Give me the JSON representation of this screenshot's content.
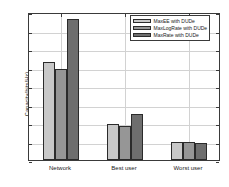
{
  "chart_data": {
    "type": "bar",
    "title": "",
    "xlabel": "",
    "ylabel": "Capacity(bits/Hz)",
    "categories": [
      "Network",
      "Best user",
      "Worst user"
    ],
    "series": [
      {
        "name": "MaxEE with DUDe",
        "values": [
          10.6,
          3.85,
          1.9
        ],
        "color": "#c8c8c8"
      },
      {
        "name": "MaxLogRate with DUDe",
        "values": [
          9.8,
          3.7,
          2.0
        ],
        "color": "#969696"
      },
      {
        "name": "MaxRate with DUDe",
        "values": [
          15.2,
          5.0,
          1.8
        ],
        "color": "#6e6e6e"
      }
    ],
    "ylim": [
      0,
      16
    ],
    "yticks": [
      0,
      2,
      4,
      6,
      8,
      10,
      12,
      14,
      16
    ],
    "ytick_labels": [
      "0",
      "2",
      "4",
      "6",
      "8",
      "10",
      "12",
      "14",
      "16"
    ],
    "grid": true,
    "legend_position": "top-right",
    "edge_color": "#2b2b2b",
    "axis_color": "#3a3a3a",
    "grid_color": "#d2d2d2",
    "background": "#ffffff"
  }
}
